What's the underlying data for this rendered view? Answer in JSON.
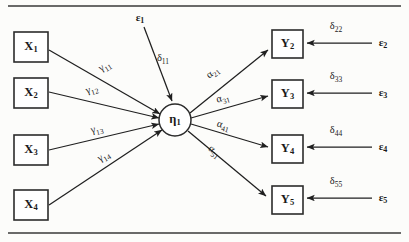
{
  "figure": {
    "type": "path-diagram",
    "background_color": "#fcfcfa",
    "line_color": "#1f1f1f",
    "rules": [
      {
        "name": "top-rule",
        "y": 6
      },
      {
        "name": "bottom-rule",
        "y": 233
      }
    ]
  },
  "exogenous": {
    "shape": "box",
    "nodes": [
      {
        "id": "x1",
        "base": "X",
        "sub": "1",
        "x": 14,
        "y": 32,
        "w": 34,
        "h": 30
      },
      {
        "id": "x2",
        "base": "X",
        "sub": "2",
        "x": 14,
        "y": 78,
        "w": 34,
        "h": 30
      },
      {
        "id": "x3",
        "base": "X",
        "sub": "3",
        "x": 14,
        "y": 135,
        "w": 34,
        "h": 30
      },
      {
        "id": "x4",
        "base": "X",
        "sub": "4",
        "x": 14,
        "y": 190,
        "w": 34,
        "h": 30
      }
    ]
  },
  "latent": {
    "shape": "circle",
    "id": "eta1",
    "base": "η",
    "sub": "1",
    "cx": 175,
    "cy": 120,
    "r": 16
  },
  "endogenous": {
    "shape": "box",
    "nodes": [
      {
        "id": "y2",
        "base": "Y",
        "sub": "2",
        "x": 272,
        "y": 30,
        "w": 31,
        "h": 28
      },
      {
        "id": "y3",
        "base": "Y",
        "sub": "3",
        "x": 272,
        "y": 80,
        "w": 31,
        "h": 28
      },
      {
        "id": "y4",
        "base": "Y",
        "sub": "4",
        "x": 272,
        "y": 135,
        "w": 31,
        "h": 28
      },
      {
        "id": "y5",
        "base": "Y",
        "sub": "5",
        "x": 272,
        "y": 186,
        "w": 31,
        "h": 28
      }
    ]
  },
  "gamma_paths": [
    {
      "id": "gamma11",
      "base": "γ",
      "sub": "11",
      "from": "x1",
      "to": "eta1",
      "x1": 49,
      "y1": 50,
      "x2": 160,
      "y2": 114,
      "lx": 105,
      "ly": 67,
      "rot": -32
    },
    {
      "id": "gamma12",
      "base": "γ",
      "sub": "12",
      "from": "x2",
      "to": "eta1",
      "x1": 49,
      "y1": 92,
      "x2": 159,
      "y2": 118,
      "lx": 92,
      "ly": 90,
      "rot": -17
    },
    {
      "id": "gamma13",
      "base": "γ",
      "sub": "13",
      "from": "x3",
      "to": "eta1",
      "x1": 49,
      "y1": 150,
      "x2": 159,
      "y2": 124,
      "lx": 97,
      "ly": 130,
      "rot": -13
    },
    {
      "id": "gamma14",
      "base": "γ",
      "sub": "14",
      "from": "x4",
      "to": "eta1",
      "x1": 49,
      "y1": 205,
      "x2": 162,
      "y2": 130,
      "lx": 104,
      "ly": 157,
      "rot": -31
    }
  ],
  "alpha_paths": [
    {
      "id": "alpha21",
      "base": "α",
      "sub": "21",
      "from": "eta1",
      "to": "y2",
      "x1": 190,
      "y1": 113,
      "x2": 268,
      "y2": 50,
      "lx": 213,
      "ly": 73,
      "rot": -39
    },
    {
      "id": "alpha31",
      "base": "α",
      "sub": "31",
      "from": "eta1",
      "to": "y3",
      "x1": 191,
      "y1": 118,
      "x2": 268,
      "y2": 96,
      "lx": 223,
      "ly": 99,
      "rot": -16
    },
    {
      "id": "alpha41",
      "base": "α",
      "sub": "41",
      "from": "eta1",
      "to": "y4",
      "x1": 191,
      "y1": 124,
      "x2": 268,
      "y2": 147,
      "lx": 223,
      "ly": 126,
      "rot": 16
    },
    {
      "id": "alpha51",
      "base": "α",
      "sub": "51",
      "from": "eta1",
      "to": "y5",
      "x1": 188,
      "y1": 131,
      "x2": 266,
      "y2": 196,
      "lx": 214,
      "ly": 152,
      "rot": 39
    }
  ],
  "disturbance": {
    "error": {
      "id": "epsilon1",
      "base": "ε",
      "sub": "1",
      "x": 140,
      "y": 18
    },
    "coefficient": {
      "id": "delta11",
      "base": "δ",
      "sub": "11",
      "x": 163,
      "y": 59
    },
    "line": {
      "x1": 144,
      "y1": 27,
      "x2": 172,
      "y2": 101
    }
  },
  "measurement_errors": [
    {
      "id": "delta22",
      "base": "δ",
      "sub": "22",
      "lx": 336,
      "ly": 27,
      "err_base": "ε",
      "err_sub": "2",
      "ex": 383,
      "ey": 43,
      "x1": 372,
      "y1": 43,
      "x2": 307,
      "y2": 43
    },
    {
      "id": "delta33",
      "base": "δ",
      "sub": "33",
      "lx": 336,
      "ly": 77,
      "err_base": "ε",
      "err_sub": "3",
      "ex": 383,
      "ey": 93,
      "x1": 372,
      "y1": 93,
      "x2": 307,
      "y2": 93
    },
    {
      "id": "delta44",
      "base": "δ",
      "sub": "44",
      "lx": 336,
      "ly": 131,
      "err_base": "ε",
      "err_sub": "4",
      "ex": 383,
      "ey": 147,
      "x1": 372,
      "y1": 147,
      "x2": 307,
      "y2": 147
    },
    {
      "id": "delta55",
      "base": "δ",
      "sub": "55",
      "lx": 336,
      "ly": 182,
      "err_base": "ε",
      "err_sub": "5",
      "ex": 383,
      "ey": 198,
      "x1": 372,
      "y1": 198,
      "x2": 307,
      "y2": 198
    }
  ]
}
